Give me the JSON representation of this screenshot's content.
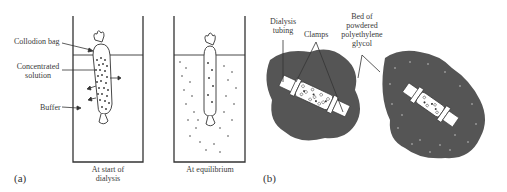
{
  "figure": {
    "panel_a": {
      "id": "(a)",
      "labels": {
        "collodion_bag": "Collodion bag",
        "concentrated_solution_1": "Concentrated",
        "concentrated_solution_2": "solution",
        "buffer": "Buffer"
      },
      "captions": {
        "start_1": "At start of",
        "start_2": "dialysis",
        "equilibrium": "At equilibrium"
      }
    },
    "panel_b": {
      "id": "(b)",
      "labels": {
        "dialysis_tubing_1": "Dialysis",
        "dialysis_tubing_2": "tubing",
        "clamps": "Clamps",
        "bed_1": "Bed of",
        "bed_2": "powdered",
        "bed_3": "polyethylene",
        "bed_4": "glycol"
      }
    },
    "colors": {
      "line": "#333333",
      "peg_bed": "#555555",
      "background": "#ffffff"
    }
  }
}
